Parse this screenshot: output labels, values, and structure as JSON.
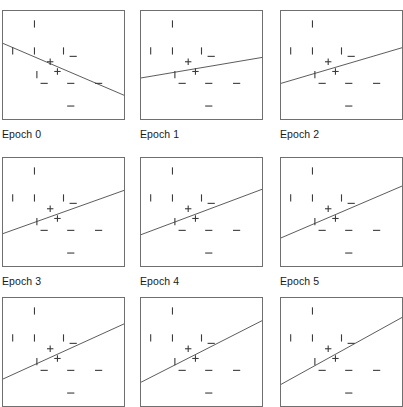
{
  "figure": {
    "title": "",
    "type": "small-multiples-scatter-grid",
    "background_color": "#ffffff",
    "panel_border_color": "#6f6f6f",
    "line_color": "#4a4a4a",
    "marker_color": "#3b3b3b",
    "label_color": "#1a1a1a",
    "columns": 3,
    "rows": 3,
    "panel_width": 123,
    "panel_height": 110,
    "col_x": [
      2,
      140,
      280
    ],
    "row_y": [
      10,
      157,
      297
    ],
    "label_offset_y": 118,
    "ghost_top_row_visible": true
  },
  "chart_data": {
    "type": "scatter",
    "title": "",
    "xlabel": "",
    "ylabel": "",
    "xlim": [
      0,
      1
    ],
    "ylim": [
      0,
      1
    ],
    "grid": false,
    "legend": "none",
    "marker_classes": [
      {
        "name": "positive",
        "glyph": "+",
        "label": "+"
      },
      {
        "name": "negative",
        "glyph": "-",
        "label": "−"
      },
      {
        "name": "tick",
        "glyph": "|",
        "label": "|"
      }
    ],
    "points": [
      {
        "x": 0.26,
        "y": 0.88,
        "cls": "tick"
      },
      {
        "x": 0.08,
        "y": 0.63,
        "cls": "tick"
      },
      {
        "x": 0.26,
        "y": 0.63,
        "cls": "tick"
      },
      {
        "x": 0.5,
        "y": 0.63,
        "cls": "tick"
      },
      {
        "x": 0.58,
        "y": 0.58,
        "cls": "negative"
      },
      {
        "x": 0.39,
        "y": 0.53,
        "cls": "positive"
      },
      {
        "x": 0.28,
        "y": 0.41,
        "cls": "tick"
      },
      {
        "x": 0.45,
        "y": 0.44,
        "cls": "positive"
      },
      {
        "x": 0.34,
        "y": 0.33,
        "cls": "negative"
      },
      {
        "x": 0.56,
        "y": 0.33,
        "cls": "negative"
      },
      {
        "x": 0.79,
        "y": 0.33,
        "cls": "negative"
      },
      {
        "x": 0.56,
        "y": 0.12,
        "cls": "negative"
      }
    ],
    "series": [
      {
        "name": "Epoch 0",
        "label": "Epoch 0",
        "boundary": {
          "x0": 0.0,
          "y0": 0.7,
          "x1": 1.0,
          "y1": 0.22
        },
        "slope": -0.48,
        "intercept": 0.7
      },
      {
        "name": "Epoch 1",
        "label": "Epoch 1",
        "boundary": {
          "x0": 0.0,
          "y0": 0.38,
          "x1": 1.0,
          "y1": 0.57
        },
        "slope": 0.19,
        "intercept": 0.38
      },
      {
        "name": "Epoch 2",
        "label": "Epoch 2",
        "boundary": {
          "x0": 0.0,
          "y0": 0.33,
          "x1": 1.0,
          "y1": 0.66
        },
        "slope": 0.33,
        "intercept": 0.33
      },
      {
        "name": "Epoch 3",
        "label": "Epoch 3",
        "boundary": {
          "x0": 0.0,
          "y0": 0.3,
          "x1": 1.0,
          "y1": 0.7
        },
        "slope": 0.4,
        "intercept": 0.3
      },
      {
        "name": "Epoch 4",
        "label": "Epoch 4",
        "boundary": {
          "x0": 0.0,
          "y0": 0.29,
          "x1": 1.0,
          "y1": 0.71
        },
        "slope": 0.42,
        "intercept": 0.29
      },
      {
        "name": "Epoch 5",
        "label": "Epoch 5",
        "boundary": {
          "x0": 0.0,
          "y0": 0.26,
          "x1": 1.0,
          "y1": 0.74
        },
        "slope": 0.48,
        "intercept": 0.26
      },
      {
        "name": "Epoch 6",
        "label": "",
        "boundary": {
          "x0": 0.0,
          "y0": 0.25,
          "x1": 1.0,
          "y1": 0.76
        },
        "slope": 0.51,
        "intercept": 0.25
      },
      {
        "name": "Epoch 7",
        "label": "",
        "boundary": {
          "x0": 0.0,
          "y0": 0.22,
          "x1": 1.0,
          "y1": 0.79
        },
        "slope": 0.57,
        "intercept": 0.22
      },
      {
        "name": "Epoch 8",
        "label": "",
        "boundary": {
          "x0": 0.0,
          "y0": 0.2,
          "x1": 1.0,
          "y1": 0.82
        },
        "slope": 0.62,
        "intercept": 0.2
      }
    ]
  },
  "labels": {
    "epoch_0": "Epoch 0",
    "epoch_1": "Epoch 1",
    "epoch_2": "Epoch 2",
    "epoch_3": "Epoch 3",
    "epoch_4": "Epoch 4",
    "epoch_5": "Epoch 5"
  }
}
